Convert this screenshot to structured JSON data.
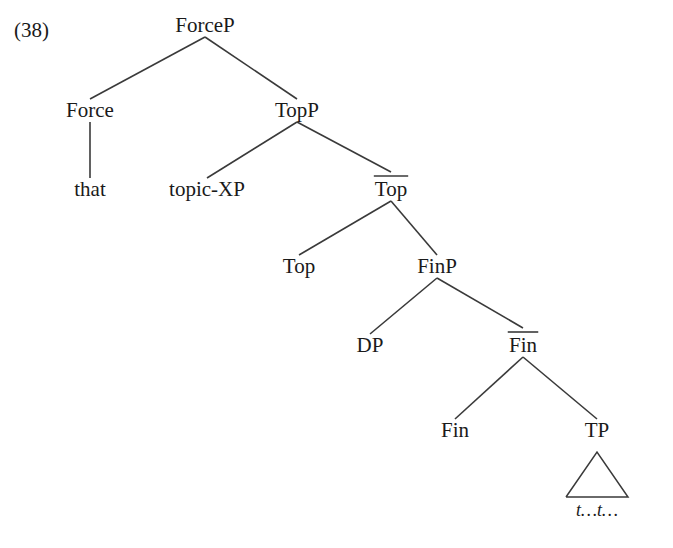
{
  "figure": {
    "example_number": "(38)",
    "background_color": "#ffffff",
    "line_color": "#3a3a3a",
    "text_color": "#1a1a1a"
  },
  "tree": {
    "description": "X-bar syntactic tree of the left periphery: ForceP dominating Force and TopP, TopP dominating topic-XP and Top-bar, Top-bar dominating Top and FinP, FinP dominating DP and Fin-bar, Fin-bar dominating Fin and TP, TP expanded as a triangle over traces.",
    "nodes": [
      {
        "id": "forceP",
        "label": "ForceP",
        "x": 205,
        "y": 32,
        "bar": false
      },
      {
        "id": "force",
        "label": "Force",
        "x": 90,
        "y": 117,
        "bar": false
      },
      {
        "id": "that",
        "label": "that",
        "x": 90,
        "y": 196,
        "bar": false
      },
      {
        "id": "topP",
        "label": "TopP",
        "x": 297,
        "y": 117,
        "bar": false
      },
      {
        "id": "topicXP",
        "label": "topic-XP",
        "x": 207,
        "y": 196,
        "bar": false
      },
      {
        "id": "topBar",
        "label": "Top",
        "x": 391,
        "y": 196,
        "bar": true
      },
      {
        "id": "top",
        "label": "Top",
        "x": 299,
        "y": 273,
        "bar": false
      },
      {
        "id": "finP",
        "label": "FinP",
        "x": 437,
        "y": 273,
        "bar": false
      },
      {
        "id": "dp",
        "label": "DP",
        "x": 370,
        "y": 352,
        "bar": false
      },
      {
        "id": "finBar",
        "label": "Fin",
        "x": 523,
        "y": 352,
        "bar": true
      },
      {
        "id": "fin",
        "label": "Fin",
        "x": 455,
        "y": 437,
        "bar": false
      },
      {
        "id": "tp",
        "label": "TP",
        "x": 597,
        "y": 437,
        "bar": false
      }
    ],
    "edges": [
      {
        "from": "forceP",
        "to": "force"
      },
      {
        "from": "forceP",
        "to": "topP"
      },
      {
        "from": "force",
        "to": "that"
      },
      {
        "from": "topP",
        "to": "topicXP"
      },
      {
        "from": "topP",
        "to": "topBar"
      },
      {
        "from": "topBar",
        "to": "top"
      },
      {
        "from": "topBar",
        "to": "finP"
      },
      {
        "from": "finP",
        "to": "dp"
      },
      {
        "from": "finP",
        "to": "finBar"
      },
      {
        "from": "finBar",
        "to": "fin"
      },
      {
        "from": "finBar",
        "to": "tp"
      }
    ],
    "triangle": {
      "parent": "tp",
      "apex_x": 597,
      "apex_y": 452,
      "base_y": 497,
      "base_left_x": 566,
      "base_right_x": 628,
      "content": "t…t…"
    }
  }
}
